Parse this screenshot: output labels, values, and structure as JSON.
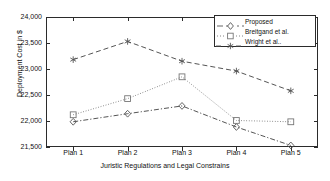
{
  "chart_data": {
    "type": "line",
    "title": "",
    "xlabel": "Juristic Regulations and Legal Constrains",
    "ylabel": "Deployment Cost in $",
    "categories": [
      "Plan 1",
      "Plan 2",
      "Plan 3",
      "Plan 4",
      "Plan 5"
    ],
    "ylim": [
      21500,
      24000
    ],
    "yticks": [
      21500,
      22000,
      22500,
      23000,
      23500,
      24000
    ],
    "ytick_labels": [
      "21,500",
      "22,000",
      "22,500",
      "23,000",
      "23,500",
      "24,000"
    ],
    "grid": false,
    "legend_position": "top-right",
    "series": [
      {
        "name": "Proposed",
        "marker": "diamond",
        "linestyle": "dash-dot",
        "color": "#555555",
        "values": [
          21985,
          22140,
          22290,
          21885,
          21530
        ]
      },
      {
        "name": "Breitgand et al.",
        "marker": "square",
        "linestyle": "dotted",
        "color": "#777777",
        "values": [
          22120,
          22430,
          22850,
          22010,
          21985
        ]
      },
      {
        "name": "Wright et al..",
        "marker": "asterisk",
        "linestyle": "dashed",
        "color": "#555555",
        "values": [
          23180,
          23530,
          23150,
          22960,
          22580
        ]
      }
    ]
  }
}
